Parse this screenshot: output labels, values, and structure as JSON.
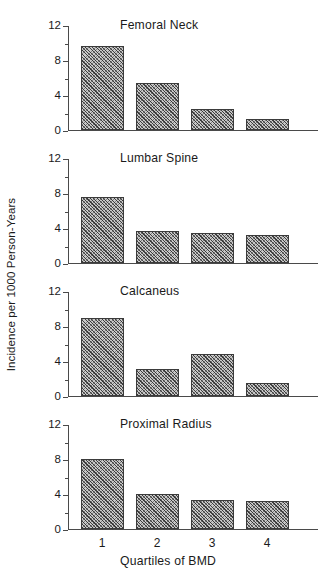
{
  "chart_data": {
    "type": "bar",
    "title": "",
    "xlabel": "Quartiles of BMD",
    "ylabel": "Incidence per 1000 Person-Years",
    "categories": [
      "1",
      "2",
      "3",
      "4"
    ],
    "ylim": [
      0,
      12
    ],
    "yticks": [
      0,
      4,
      8,
      12
    ],
    "ytick_labels": [
      "0",
      "4",
      "8",
      "12"
    ],
    "yminor_ticks": [
      2,
      6,
      10
    ],
    "grid": false,
    "legend": null,
    "panels": [
      {
        "title": "Femoral Neck",
        "values": [
          9.6,
          5.4,
          2.4,
          1.3
        ]
      },
      {
        "title": "Lumbar Spine",
        "values": [
          7.5,
          3.7,
          3.4,
          3.2
        ]
      },
      {
        "title": "Calcaneus",
        "values": [
          8.9,
          3.1,
          4.8,
          1.5
        ]
      },
      {
        "title": "Proximal Radius",
        "values": [
          8.0,
          4.0,
          3.3,
          3.2
        ]
      }
    ]
  },
  "colors": {
    "bar_fill": "#c9c9c9",
    "bar_edge": "#3b3b3b",
    "axis": "#4a4a4a",
    "text": "#1a1a1a",
    "background": "#ffffff"
  }
}
